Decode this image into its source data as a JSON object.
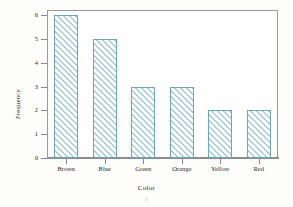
{
  "chart_data": {
    "type": "bar",
    "title": "",
    "subtitle": "",
    "xlabel": "Color",
    "ylabel": "Frequency",
    "categories": [
      "Brown",
      "Blue",
      "Green",
      "Orange",
      "Yellow",
      "Red"
    ],
    "values": [
      6,
      5,
      3,
      3,
      2,
      2
    ],
    "ylim": [
      0,
      6
    ],
    "xlim": null,
    "ytick_labels": [
      "0",
      "1",
      "2",
      "3",
      "4",
      "5",
      "6"
    ],
    "ytick_values": [
      0,
      1,
      2,
      3,
      4,
      5,
      6
    ],
    "grid": false,
    "legend": null,
    "legend_position": "none",
    "bar_fill": "diagonal-hatch",
    "annotations": []
  },
  "style": {
    "bar_edge_color": "#6fa5b4",
    "bar_hatch_color": "#a9ced8",
    "bar_face_color": "#fbfdfd",
    "axis_color": "#8a8a8a",
    "frame_color": "#9a9a9a",
    "text_color": "#2b2b2b",
    "page_background": "#fdfdfc",
    "plot_background": "#fefefe"
  },
  "artifacts": {
    "stray_mark": "ʅ"
  }
}
